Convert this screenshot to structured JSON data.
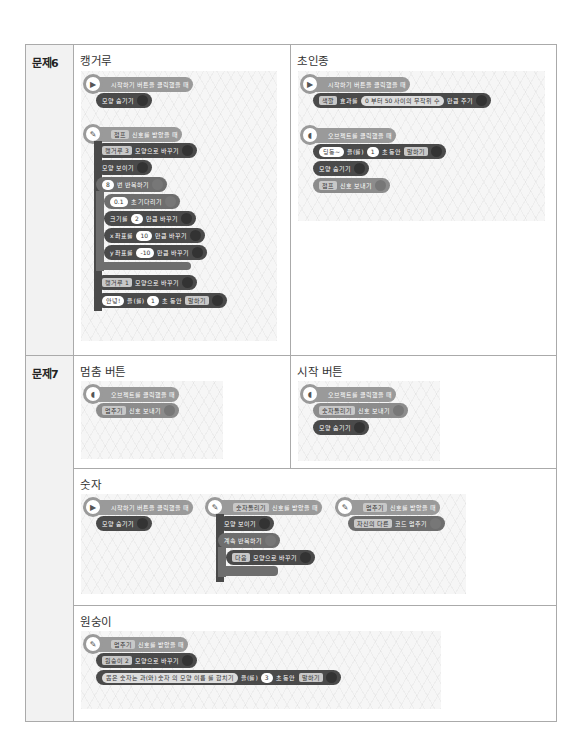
{
  "problems": [
    {
      "label": "문제6",
      "cells": [
        {
          "title": "캥거루",
          "scripts": [
            {
              "hat": {
                "icon": "play-icon",
                "text": "시작하기 버튼을 클릭했을 때"
              },
              "blocks": [
                {
                  "text": "모양 숨기기"
                }
              ]
            },
            {
              "hat": {
                "icon": "signal-icon",
                "dropdown": "점프",
                "text": "신호를 받았을 때"
              },
              "blocks": [
                {
                  "dropdown": "캥거루 3",
                  "text": "모양으로 바꾸기"
                },
                {
                  "text": "모양 보이기"
                },
                {
                  "value": "8",
                  "text": "번 반복하기"
                },
                {
                  "value": "0.1",
                  "text": "초 기다리기"
                },
                {
                  "prefix": "크기를",
                  "value": "2",
                  "text": "만큼 바꾸기"
                },
                {
                  "prefix": "x 좌표를",
                  "value": "10",
                  "text": "만큼 바꾸기"
                },
                {
                  "prefix": "y 좌표를",
                  "value": "-10",
                  "text": "만큼 바꾸기"
                },
                {
                  "dropdown": "캥거루 1",
                  "text": "모양으로 바꾸기"
                },
                {
                  "value": "안녕!",
                  "mid": "을(를)",
                  "value2": "1",
                  "text": "초 동안",
                  "dropdown": "말하기"
                }
              ]
            }
          ]
        },
        {
          "title": "초인종",
          "scripts": [
            {
              "hat": {
                "icon": "play-icon",
                "text": "시작하기 버튼을 클릭했을 때"
              },
              "blocks": [
                {
                  "dropdown": "색깔",
                  "prefix": "효과를",
                  "from": "0",
                  "from_label": "부터",
                  "to": "50",
                  "range_label": "사이의 무작위 수",
                  "text": "만큼 주기"
                }
              ]
            },
            {
              "hat": {
                "icon": "object-click-icon",
                "text": "오브젝트를 클릭했을 때"
              },
              "blocks": [
                {
                  "value": "딩동~",
                  "mid": "을(를)",
                  "value2": "1",
                  "text": "초 동안",
                  "dropdown": "말하기"
                },
                {
                  "text": "모양 숨기기"
                },
                {
                  "dropdown": "점프",
                  "text": "신호 보내기"
                }
              ]
            }
          ]
        }
      ]
    },
    {
      "label": "문제7",
      "cells": [
        {
          "title": "멈춤 버튼",
          "scripts": [
            {
              "hat": {
                "icon": "object-click-icon",
                "text": "오브젝트를 클릭했을 때"
              },
              "blocks": [
                {
                  "dropdown": "멈추기",
                  "text": "신호 보내기"
                }
              ]
            }
          ]
        },
        {
          "title": "시작 버튼",
          "scripts": [
            {
              "hat": {
                "icon": "object-click-icon",
                "text": "오브젝트를 클릭했을 때"
              },
              "blocks": [
                {
                  "dropdown": "숫자돌리기",
                  "text": "신호 보내기"
                },
                {
                  "text": "모양 숨기기"
                }
              ]
            }
          ]
        },
        {
          "title": "숫자",
          "scripts": [
            {
              "hat": {
                "icon": "play-icon",
                "text": "시작하기 버튼을 클릭했을 때"
              },
              "blocks": [
                {
                  "text": "모양 숨기기"
                }
              ]
            },
            {
              "hat": {
                "icon": "signal-icon",
                "dropdown": "숫자돌리기",
                "text": "신호를 받았을 때"
              },
              "blocks": [
                {
                  "text": "모양 보이기"
                },
                {
                  "text": "계속 반복하기"
                },
                {
                  "dropdown": "다음",
                  "text": "모양으로 바꾸기"
                }
              ]
            },
            {
              "hat": {
                "icon": "signal-icon",
                "dropdown": "멈추기",
                "text": "신호를 받았을 때"
              },
              "blocks": [
                {
                  "dropdown": "자신의 다른",
                  "text": "코드 멈추기"
                }
              ]
            }
          ]
        },
        {
          "title": "원숭이",
          "scripts": [
            {
              "hat": {
                "icon": "signal-icon",
                "dropdown": "멈추기",
                "text": "신호를 받았을 때"
              },
              "blocks": [
                {
                  "dropdown": "원숭이 2",
                  "text": "모양으로 바꾸기"
                },
                {
                  "value": "뽑은 숫자는",
                  "join1": "과(와)",
                  "dd1": "숫자",
                  "of": "의",
                  "dd2": "모양 이름",
                  "join2": "를 합치기",
                  "mid": "을(를)",
                  "value2": "3",
                  "text": "초 동안",
                  "dropdown": "말하기"
                }
              ]
            }
          ]
        }
      ]
    }
  ]
}
